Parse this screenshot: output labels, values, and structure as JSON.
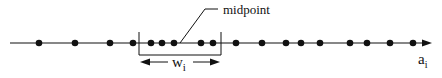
{
  "diagram": {
    "axis": {
      "x_start": 10,
      "x_end": 430,
      "y": 43,
      "color": "#111111"
    },
    "points_x": [
      39,
      75,
      110,
      133,
      151,
      162,
      174,
      201,
      213,
      236,
      262,
      286,
      301,
      320,
      350,
      367,
      390,
      413
    ],
    "window": {
      "x_left": 139,
      "x_right": 221,
      "bottom_y": 55,
      "label": "w",
      "label_sub": "i"
    },
    "midpoint": {
      "label": "midpoint",
      "anchor_x": 180
    },
    "axis_label": {
      "text": "a",
      "sub": "i"
    }
  }
}
